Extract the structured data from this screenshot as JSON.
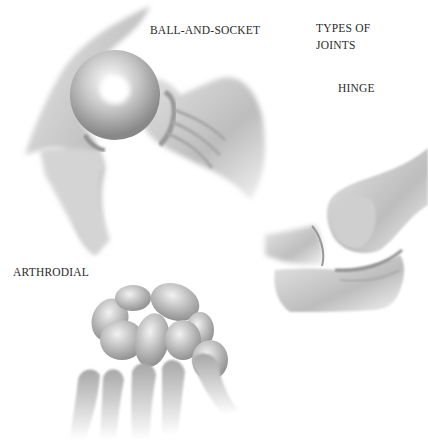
{
  "title": {
    "line1": "TYPES OF",
    "line2": "JOINTS"
  },
  "labels": {
    "ball_and_socket": "BALL-AND-SOCKET",
    "hinge": "HINGE",
    "arthrodial": "ARTHRODIAL"
  },
  "colors": {
    "background": "#ffffff",
    "text": "#2a2a2a",
    "bone_light": "#f0f0f0",
    "bone_dark": "#8a8a8a"
  }
}
